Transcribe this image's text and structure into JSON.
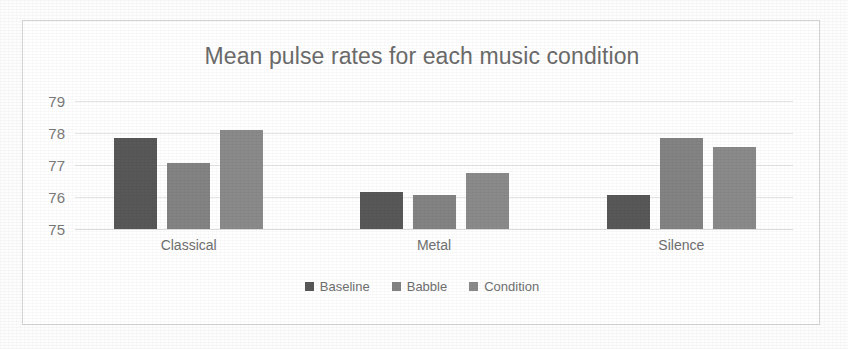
{
  "chart_data": {
    "type": "bar",
    "title": "Mean pulse rates for each music condition",
    "xlabel": "",
    "ylabel": "",
    "categories": [
      "Classical",
      "Metal",
      "Silence"
    ],
    "series": [
      {
        "name": "Baseline",
        "color": "#585858",
        "values": [
          77.85,
          76.15,
          76.05
        ]
      },
      {
        "name": "Babble",
        "color": "#838383",
        "values": [
          77.05,
          76.05,
          77.85
        ]
      },
      {
        "name": "Condition",
        "color": "#8a8a8a",
        "values": [
          78.1,
          76.75,
          77.55
        ]
      }
    ],
    "ylim": [
      75,
      79
    ],
    "yticks": [
      79,
      78,
      77,
      76,
      75
    ],
    "ytick_labels": [
      "79",
      "78",
      "77",
      "76",
      "75"
    ],
    "grid": true,
    "legend_position": "bottom"
  },
  "colors": {
    "title_text": "#6b6b6b",
    "tick_text": "#7a7a7a",
    "gridline": "#e6e6e6",
    "frame_border": "#d4d4d4",
    "page_background": "#fdfdfd"
  }
}
